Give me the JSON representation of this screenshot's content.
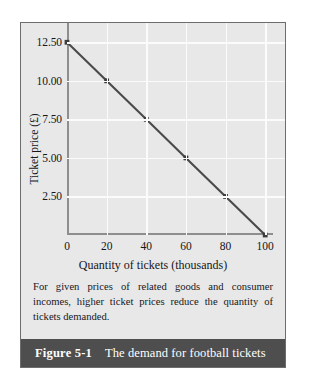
{
  "figure": {
    "number_label": "Figure 5-1",
    "title": "The demand for football tickets",
    "caption": "For given prices of related goods and consumer incomes, higher ticket prices reduce the quantity of tickets demanded.",
    "panel_bg": "#e8e8e8",
    "title_bar_bg": "#4e4e4e",
    "title_bar_text_color": "#ffffff",
    "border_color": "#6d6d6d"
  },
  "chart_data": {
    "type": "line",
    "title": "",
    "xlabel": "Quantity of tickets (thousands)",
    "ylabel": "Ticket price (£)",
    "x": [
      0,
      20,
      40,
      60,
      80,
      100
    ],
    "values": [
      12.5,
      10.0,
      7.5,
      5.0,
      2.5,
      0.0
    ],
    "series": [
      {
        "name": "Demand",
        "values": [
          12.5,
          10.0,
          7.5,
          5.0,
          2.5,
          0.0
        ]
      }
    ],
    "xlim": [
      0,
      110
    ],
    "ylim": [
      0,
      13.75
    ],
    "xticks": [
      0,
      20,
      40,
      60,
      80,
      100
    ],
    "xtick_labels": [
      "0",
      "20",
      "40",
      "60",
      "80",
      "100"
    ],
    "yticks": [
      2.5,
      5.0,
      7.5,
      10.0,
      12.5
    ],
    "ytick_labels": [
      "2.50",
      "5.00",
      "7.50",
      "10.00",
      "12.50"
    ],
    "grid": true,
    "grid_color": "#fbfbfb",
    "legend": "none",
    "line_color": "#4a4a4a",
    "marker": "square",
    "marker_color": "#3c3c3c",
    "axis_color": "#8e8e8e"
  }
}
